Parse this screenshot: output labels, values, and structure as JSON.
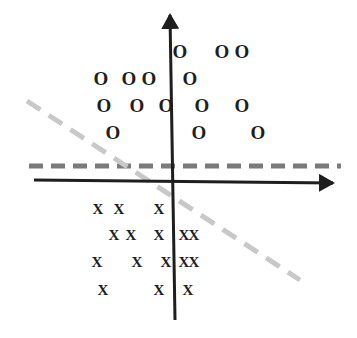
{
  "diagram": {
    "type": "linear-separability-scatter",
    "colors": {
      "axis": "#1e1e1e",
      "horizontal_boundary": "#7a7a7a",
      "diagonal_boundary": "#c8c8c8",
      "markers": "#1e1e1e",
      "background": "#ffffff"
    },
    "axes": {
      "x_axis": {
        "x1": 34,
        "y1": 180,
        "x2": 333,
        "y2": 183
      },
      "y_axis": {
        "x1": 175,
        "y1": 320,
        "x2": 170,
        "y2": 15
      }
    },
    "boundaries": [
      {
        "name": "horizontal-dashed-boundary",
        "x1": 29,
        "y1": 166,
        "x2": 341,
        "y2": 166,
        "style": "dashed-dark-gray"
      },
      {
        "name": "diagonal-dashed-boundary",
        "x1": 27,
        "y1": 101,
        "x2": 300,
        "y2": 280,
        "style": "dashed-light-gray"
      }
    ],
    "class_o": {
      "symbol": "O",
      "points": [
        [
          180,
          51
        ],
        [
          222,
          51
        ],
        [
          242,
          51
        ],
        [
          101,
          78
        ],
        [
          129,
          78
        ],
        [
          149,
          78
        ],
        [
          190,
          78
        ],
        [
          104,
          105
        ],
        [
          137,
          105
        ],
        [
          166,
          105
        ],
        [
          202,
          105
        ],
        [
          242,
          105
        ],
        [
          113,
          132
        ],
        [
          199,
          132
        ],
        [
          258,
          132
        ]
      ]
    },
    "class_x": {
      "symbol": "X",
      "points": [
        [
          98,
          209
        ],
        [
          119,
          209
        ],
        [
          159,
          209
        ],
        [
          114,
          235
        ],
        [
          131,
          235
        ],
        [
          159,
          235
        ],
        [
          184,
          235
        ],
        [
          194,
          235
        ],
        [
          97,
          262
        ],
        [
          137,
          262
        ],
        [
          166,
          262
        ],
        [
          184,
          262
        ],
        [
          194,
          262
        ],
        [
          103,
          290
        ],
        [
          159,
          290
        ],
        [
          188,
          290
        ]
      ]
    }
  }
}
